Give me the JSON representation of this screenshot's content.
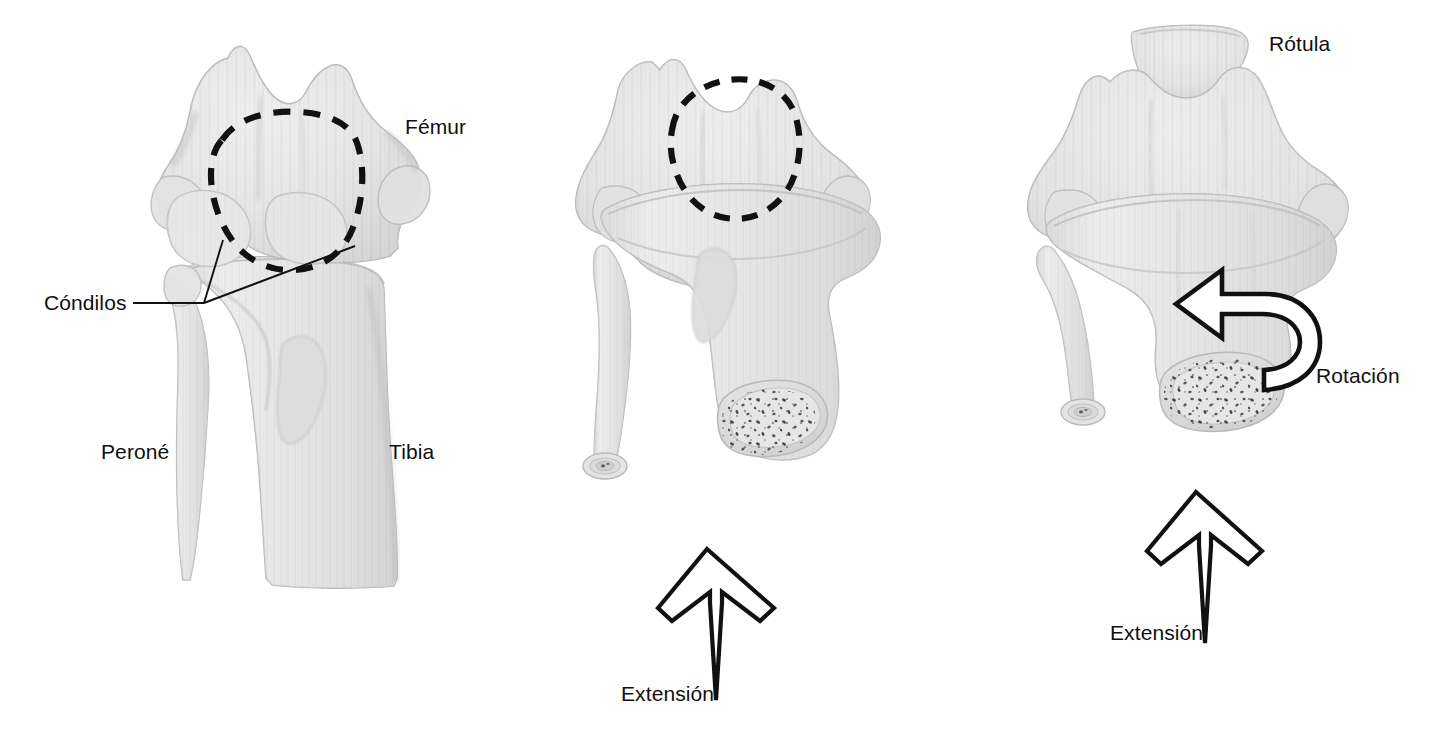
{
  "figure": {
    "language": "es",
    "background_color": "#ffffff",
    "text_color": "#100f0f",
    "bone_fill": "#e9e9e9",
    "bone_shade": "#cfcfcf",
    "bone_outline": "#b5b5b5",
    "marrow_fill": "#dedede",
    "dash_color": "#111111",
    "arrow_stroke": "#111111"
  },
  "panels": [
    {
      "id": "panel-left",
      "name": "flexed-knee-anterior-view",
      "labels": [
        {
          "key": "femur",
          "text": "Fémur"
        },
        {
          "key": "condilos",
          "text": "Cóndilos"
        },
        {
          "key": "perone",
          "text": "Peroné"
        },
        {
          "key": "tibia",
          "text": "Tibia"
        }
      ],
      "highlight": "dashed-outline-condyle-region",
      "arrows": []
    },
    {
      "id": "panel-middle",
      "name": "knee-extension-view",
      "labels": [
        {
          "key": "extension",
          "text": "Extensión"
        }
      ],
      "highlight": "dashed-outline-trochlea-region",
      "arrows": [
        {
          "key": "extension",
          "text": "Extensión",
          "type": "straight-up-arrow"
        }
      ]
    },
    {
      "id": "panel-right",
      "name": "knee-rotation-extension-view",
      "labels": [
        {
          "key": "rotula",
          "text": "Rótula"
        },
        {
          "key": "rotacion",
          "text": "Rotación"
        },
        {
          "key": "extension",
          "text": "Extensión"
        }
      ],
      "highlight": "none",
      "arrows": [
        {
          "key": "rotacion",
          "text": "Rotación",
          "type": "curved-rotation-arrow"
        },
        {
          "key": "extension",
          "text": "Extensión",
          "type": "straight-up-arrow"
        }
      ]
    }
  ],
  "annotations": {
    "femur": {
      "text": "Fémur",
      "x": 405,
      "y": 116
    },
    "condilos": {
      "text": "Cóndilos",
      "x": 44,
      "y": 292
    },
    "perone": {
      "text": "Peroné",
      "x": 101,
      "y": 441
    },
    "tibia": {
      "text": "Tibia",
      "x": 389,
      "y": 441
    },
    "extension_middle": {
      "text": "Extensión",
      "x": 621,
      "y": 683
    },
    "rotula": {
      "text": "Rótula",
      "x": 1269,
      "y": 33
    },
    "rotacion": {
      "text": "Rotación",
      "x": 1316,
      "y": 365
    },
    "extension_right": {
      "text": "Extensión",
      "x": 1110,
      "y": 622
    }
  }
}
